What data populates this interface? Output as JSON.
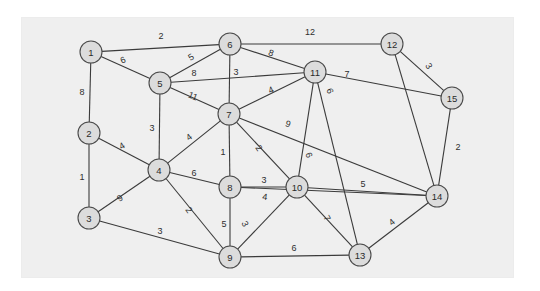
{
  "figure": {
    "type": "weighted-undirected-graph",
    "background_color": "#ffffff",
    "panel_color": "#efefef",
    "node_fill": "#dcdcdc",
    "node_stroke": "#4a4a4a",
    "edge_color": "#3b3b3b"
  },
  "chart_data": {
    "type": "diagram",
    "title": "",
    "nodes": [
      {
        "id": "1",
        "label": "1",
        "x": 91,
        "y": 52
      },
      {
        "id": "2",
        "label": "2",
        "x": 89,
        "y": 133
      },
      {
        "id": "3",
        "label": "3",
        "x": 89,
        "y": 218
      },
      {
        "id": "4",
        "label": "4",
        "x": 159,
        "y": 170
      },
      {
        "id": "5",
        "label": "5",
        "x": 160,
        "y": 83
      },
      {
        "id": "6",
        "label": "6",
        "x": 230,
        "y": 44
      },
      {
        "id": "7",
        "label": "7",
        "x": 229,
        "y": 114
      },
      {
        "id": "8",
        "label": "8",
        "x": 230,
        "y": 187
      },
      {
        "id": "9",
        "label": "9",
        "x": 230,
        "y": 257
      },
      {
        "id": "10",
        "label": "10",
        "x": 297,
        "y": 187
      },
      {
        "id": "11",
        "label": "11",
        "x": 315,
        "y": 72
      },
      {
        "id": "12",
        "label": "12",
        "x": 392,
        "y": 44
      },
      {
        "id": "13",
        "label": "13",
        "x": 360,
        "y": 255
      },
      {
        "id": "14",
        "label": "14",
        "x": 437,
        "y": 196
      },
      {
        "id": "15",
        "label": "15",
        "x": 452,
        "y": 98
      }
    ],
    "node_radius": 11,
    "edges": [
      {
        "source": "1",
        "target": "6",
        "weight": 2,
        "lx": 161,
        "ly": 36,
        "rot": 0
      },
      {
        "source": "1",
        "target": "5",
        "weight": 6,
        "lx": 123,
        "ly": 60,
        "rot": -22
      },
      {
        "source": "1",
        "target": "2",
        "weight": 8,
        "lx": 82,
        "ly": 92,
        "rot": 0
      },
      {
        "source": "2",
        "target": "3",
        "weight": 1,
        "lx": 82,
        "ly": 177,
        "rot": 0
      },
      {
        "source": "2",
        "target": "4",
        "weight": 4,
        "lx": 122,
        "ly": 146,
        "rot": -30
      },
      {
        "source": "3",
        "target": "4",
        "weight": 9,
        "lx": 120,
        "ly": 198,
        "rot": -34
      },
      {
        "source": "3",
        "target": "9",
        "weight": 3,
        "lx": 160,
        "ly": 231,
        "rot": 0
      },
      {
        "source": "4",
        "target": "5",
        "weight": 3,
        "lx": 152,
        "ly": 128,
        "rot": 0
      },
      {
        "source": "4",
        "target": "7",
        "weight": 4,
        "lx": 189,
        "ly": 137,
        "rot": -36
      },
      {
        "source": "4",
        "target": "8",
        "weight": 6,
        "lx": 194,
        "ly": 173,
        "rot": 0
      },
      {
        "source": "4",
        "target": "9",
        "weight": 2,
        "lx": 189,
        "ly": 210,
        "rot": 54
      },
      {
        "source": "5",
        "target": "6",
        "weight": 5,
        "lx": 191,
        "ly": 57,
        "rot": -32
      },
      {
        "source": "5",
        "target": "11",
        "weight": 8,
        "lx": 194,
        "ly": 73,
        "rot": 0
      },
      {
        "source": "5",
        "target": "7",
        "weight": 11,
        "lx": 193,
        "ly": 96,
        "rot": 22
      },
      {
        "source": "6",
        "target": "7",
        "weight": 3,
        "lx": 236,
        "ly": 72,
        "rot": 0
      },
      {
        "source": "6",
        "target": "11",
        "weight": 8,
        "lx": 271,
        "ly": 53,
        "rot": 19
      },
      {
        "source": "6",
        "target": "12",
        "weight": 12,
        "lx": 310,
        "ly": 32,
        "rot": 0
      },
      {
        "source": "7",
        "target": "11",
        "weight": 4,
        "lx": 271,
        "ly": 90,
        "rot": -25
      },
      {
        "source": "7",
        "target": "8",
        "weight": 1,
        "lx": 223,
        "ly": 152,
        "rot": 0
      },
      {
        "source": "7",
        "target": "10",
        "weight": 2,
        "lx": 259,
        "ly": 148,
        "rot": 55
      },
      {
        "source": "7",
        "target": "14",
        "weight": 9,
        "lx": 288,
        "ly": 124,
        "rot": 18
      },
      {
        "source": "8",
        "target": "10",
        "weight": 3,
        "lx": 264,
        "ly": 180,
        "rot": 0
      },
      {
        "source": "8",
        "target": "14",
        "weight": 4,
        "lx": 265,
        "ly": 197,
        "rot": 8
      },
      {
        "source": "8",
        "target": "9",
        "weight": 5,
        "lx": 224,
        "ly": 224,
        "rot": 0
      },
      {
        "source": "9",
        "target": "10",
        "weight": 3,
        "lx": 245,
        "ly": 224,
        "rot": 63
      },
      {
        "source": "9",
        "target": "13",
        "weight": 6,
        "lx": 294,
        "ly": 248,
        "rot": 0
      },
      {
        "source": "10",
        "target": "11",
        "weight": 6,
        "lx": 309,
        "ly": 155,
        "rot": 70
      },
      {
        "source": "10",
        "target": "14",
        "weight": 5,
        "lx": 363,
        "ly": 184,
        "rot": 0
      },
      {
        "source": "10",
        "target": "13",
        "weight": 7,
        "lx": 327,
        "ly": 218,
        "rot": 62
      },
      {
        "source": "11",
        "target": "15",
        "weight": 7,
        "lx": 347,
        "ly": 74,
        "rot": 0
      },
      {
        "source": "11",
        "target": "13",
        "weight": 6,
        "lx": 330,
        "ly": 91,
        "rot": 68
      },
      {
        "source": "12",
        "target": "15",
        "weight": 3,
        "lx": 429,
        "ly": 66,
        "rot": 58
      },
      {
        "source": "12",
        "target": "14",
        "weight": null,
        "lx": 0,
        "ly": 0,
        "rot": 0
      },
      {
        "source": "15",
        "target": "14",
        "weight": 2,
        "lx": 458,
        "ly": 147,
        "rot": 0
      },
      {
        "source": "13",
        "target": "14",
        "weight": 4,
        "lx": 392,
        "ly": 222,
        "rot": -38
      }
    ]
  }
}
